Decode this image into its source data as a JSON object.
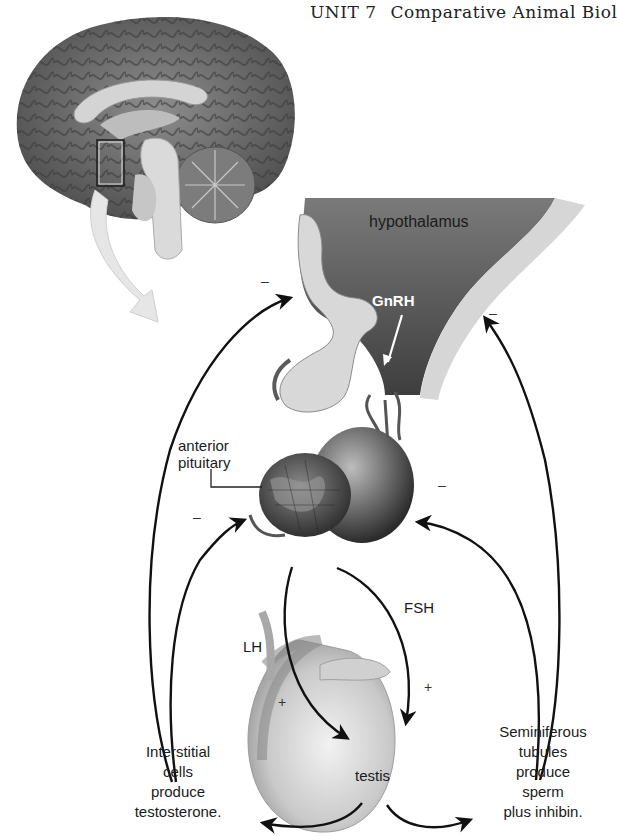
{
  "header": {
    "unit": "UNIT 7",
    "title": "Comparative Animal Biol"
  },
  "figure": {
    "labels": {
      "hypothalamus": "hypothalamus",
      "gnrh": "GnRH",
      "anterior_pituitary_line1": "anterior",
      "anterior_pituitary_line2": "pituitary",
      "lh": "LH",
      "fsh": "FSH",
      "testis": "testis",
      "interstitial": [
        "Interstitial",
        "cells",
        "produce",
        "testosterone."
      ],
      "seminiferous": [
        "Seminiferous",
        "tubules",
        "produce",
        "sperm",
        "plus inhibin."
      ]
    },
    "signs": {
      "neg_hypothalamus_left": "–",
      "neg_hypothalamus_right": "–",
      "neg_pituitary_left": "–",
      "neg_pituitary_right": "–",
      "pos_lh": "+",
      "pos_fsh": "+"
    },
    "colors": {
      "arrow": "#111111",
      "tissue_dark": "#4a4a4a",
      "tissue_light": "#d9d9d9",
      "brain": "#6b6b6b",
      "zoom_arrow": "#e6e6e6"
    }
  }
}
